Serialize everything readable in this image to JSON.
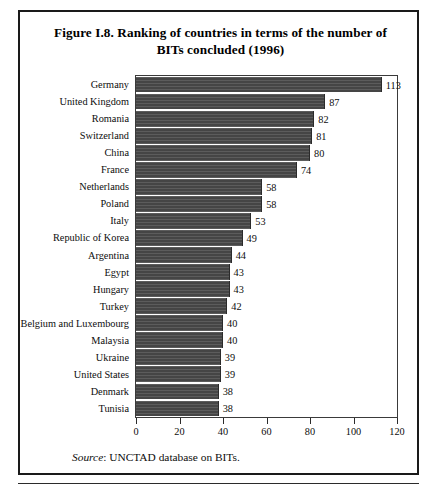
{
  "figure": {
    "title_line1": "Figure I.8.  Ranking of countries in terms of the number of",
    "title_line2": "BITs concluded (1996)",
    "source_label": "Source",
    "source_separator": ":",
    "source_text": "UNCTAD database on BITs.",
    "bar_color": "#4a4a4a",
    "frame_color": "#1a1a1a",
    "background_color": "#ffffff"
  },
  "chart_data": {
    "type": "bar",
    "orientation": "horizontal",
    "title": "Figure I.8.  Ranking of countries in terms of the number of BITs concluded (1996)",
    "xlabel": "",
    "ylabel": "",
    "xlim": [
      0,
      120
    ],
    "xticks": [
      0,
      20,
      40,
      60,
      80,
      100,
      120
    ],
    "grid": false,
    "legend": false,
    "categories": [
      "Germany",
      "United Kingdom",
      "Romania",
      "Switzerland",
      "China",
      "France",
      "Netherlands",
      "Poland",
      "Italy",
      "Republic of Korea",
      "Argentina",
      "Egypt",
      "Hungary",
      "Turkey",
      "Belgium and Luxembourg",
      "Malaysia",
      "Ukraine",
      "United States",
      "Denmark",
      "Tunisia"
    ],
    "values": [
      113,
      87,
      82,
      81,
      80,
      74,
      58,
      58,
      53,
      49,
      44,
      43,
      43,
      42,
      40,
      40,
      39,
      39,
      38,
      38
    ],
    "value_labels": [
      "113",
      "87",
      "82",
      "81",
      "80",
      "74",
      "58",
      "58",
      "53",
      "49",
      "44",
      "43",
      "43",
      "42",
      "40",
      "40",
      "39",
      "39",
      "38",
      "38"
    ],
    "tick_labels": [
      "0",
      "20",
      "40",
      "60",
      "80",
      "100",
      "120"
    ]
  }
}
